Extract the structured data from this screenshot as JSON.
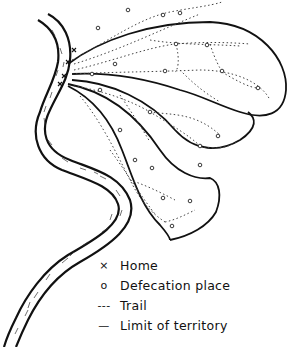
{
  "diagram": {
    "type": "territory map",
    "elements": [
      "river",
      "territory outline",
      "trails",
      "homes",
      "defecation places"
    ]
  },
  "legend": {
    "items": [
      {
        "symbol": "×",
        "label": "Home"
      },
      {
        "symbol": "o",
        "label": "Defecation place"
      },
      {
        "symbol": "---",
        "label": "Trail"
      },
      {
        "symbol": "—",
        "label": "Limit of territory"
      }
    ]
  },
  "colors": {
    "ink": "#111111",
    "background": "#ffffff"
  }
}
